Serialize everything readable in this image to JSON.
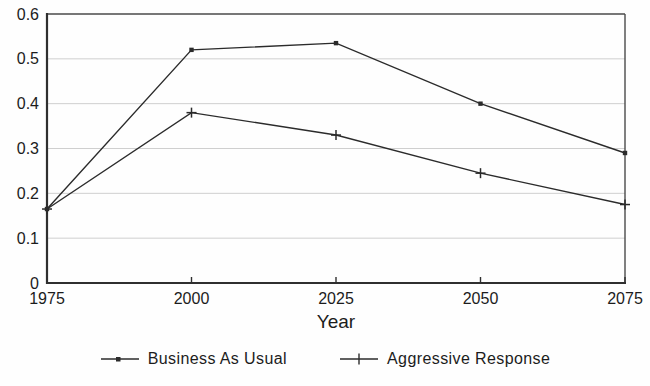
{
  "chart_data": {
    "type": "line",
    "title": "",
    "xlabel": "Year",
    "ylabel": "",
    "x": [
      1975,
      2000,
      2025,
      2050,
      2075
    ],
    "x_tick_labels": [
      "1975",
      "2000",
      "2025",
      "2050",
      "2075"
    ],
    "xlim": [
      1975,
      2075
    ],
    "ylim": [
      0,
      0.6
    ],
    "y_ticks": [
      0,
      0.1,
      0.2,
      0.3,
      0.4,
      0.5,
      0.6
    ],
    "y_tick_labels": [
      "0",
      "0.1",
      "0.2",
      "0.3",
      "0.4",
      "0.5",
      "0.6"
    ],
    "grid": "horizontal",
    "legend_position": "bottom-center",
    "series": [
      {
        "name": "Business As Usual",
        "marker": "dot",
        "values": [
          0.165,
          0.52,
          0.535,
          0.4,
          0.29
        ]
      },
      {
        "name": "Aggressive Response",
        "marker": "plus",
        "values": [
          0.165,
          0.38,
          0.33,
          0.245,
          0.175
        ]
      }
    ],
    "colors": {
      "line": "#2b2b2b",
      "grid": "#cfcfcf",
      "axis": "#2f2f2f",
      "border": "#4a4a4a",
      "text": "#1c1c1c"
    }
  }
}
